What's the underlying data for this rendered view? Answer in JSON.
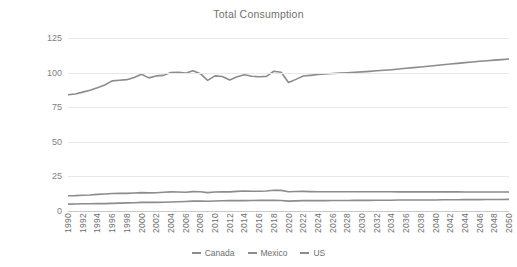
{
  "chart_data": {
    "type": "line",
    "title": "Total Consumption",
    "xlabel": "",
    "ylabel": "Quad Btu",
    "ylim": [
      0,
      125
    ],
    "yticks": [
      0,
      25,
      50,
      75,
      100,
      125
    ],
    "ytick_labels": [
      "0",
      "25",
      "50",
      "75",
      "100",
      "125"
    ],
    "grid": true,
    "legend_position": "bottom",
    "x": [
      1990,
      1991,
      1992,
      1993,
      1994,
      1995,
      1996,
      1997,
      1998,
      1999,
      2000,
      2001,
      2002,
      2003,
      2004,
      2005,
      2006,
      2007,
      2008,
      2009,
      2010,
      2011,
      2012,
      2013,
      2014,
      2015,
      2016,
      2017,
      2018,
      2019,
      2020,
      2021,
      2022,
      2023,
      2024,
      2025,
      2026,
      2027,
      2028,
      2029,
      2030,
      2031,
      2032,
      2033,
      2034,
      2035,
      2036,
      2037,
      2038,
      2039,
      2040,
      2041,
      2042,
      2043,
      2044,
      2045,
      2046,
      2047,
      2048,
      2049,
      2050
    ],
    "xtick_labels": [
      "1990",
      "1992",
      "1994",
      "1996",
      "1998",
      "2000",
      "2002",
      "2004",
      "2006",
      "2008",
      "2010",
      "2012",
      "2014",
      "2016",
      "2018",
      "2020",
      "2022",
      "2024",
      "2026",
      "2028",
      "2030",
      "2032",
      "2034",
      "2036",
      "2038",
      "2040",
      "2042",
      "2044",
      "2046",
      "2048",
      "2050"
    ],
    "series": [
      {
        "name": "Canada",
        "color": "#8c8c8c",
        "values": [
          11.0,
          11.1,
          11.4,
          11.6,
          12.0,
          12.3,
          12.6,
          12.7,
          12.7,
          13.0,
          13.3,
          13.1,
          13.2,
          13.6,
          13.8,
          13.7,
          13.6,
          14.0,
          13.9,
          13.3,
          13.7,
          13.9,
          13.8,
          14.2,
          14.4,
          14.3,
          14.3,
          14.5,
          15.0,
          14.9,
          13.9,
          14.1,
          14.2,
          14.0,
          13.9,
          13.9,
          13.9,
          13.9,
          13.9,
          13.9,
          13.9,
          13.9,
          13.9,
          13.9,
          13.9,
          13.8,
          13.8,
          13.8,
          13.8,
          13.8,
          13.8,
          13.8,
          13.8,
          13.8,
          13.7,
          13.7,
          13.7,
          13.7,
          13.7,
          13.7,
          13.7
        ]
      },
      {
        "name": "Mexico",
        "color": "#8c8c8c",
        "values": [
          5.0,
          5.1,
          5.2,
          5.2,
          5.4,
          5.3,
          5.5,
          5.7,
          5.9,
          6.0,
          6.2,
          6.2,
          6.2,
          6.3,
          6.5,
          6.7,
          6.9,
          7.1,
          7.2,
          7.0,
          7.2,
          7.4,
          7.5,
          7.5,
          7.5,
          7.6,
          7.7,
          7.7,
          7.7,
          7.6,
          7.1,
          7.3,
          7.5,
          7.5,
          7.5,
          7.5,
          7.6,
          7.6,
          7.6,
          7.7,
          7.7,
          7.7,
          7.8,
          7.8,
          7.8,
          7.9,
          7.9,
          7.9,
          8.0,
          8.0,
          8.0,
          8.1,
          8.1,
          8.1,
          8.2,
          8.2,
          8.2,
          8.3,
          8.3,
          8.3,
          8.4
        ]
      },
      {
        "name": "US",
        "color": "#8c8c8c",
        "values": [
          84.0,
          84.5,
          85.9,
          87.2,
          89.0,
          91.0,
          94.0,
          94.5,
          94.9,
          96.5,
          98.8,
          96.2,
          97.6,
          98.0,
          100.1,
          100.2,
          99.6,
          101.3,
          99.2,
          94.4,
          97.6,
          97.2,
          94.6,
          97.0,
          98.4,
          97.4,
          97.0,
          97.3,
          101.0,
          100.2,
          92.9,
          95.1,
          97.5,
          98.0,
          98.6,
          99.0,
          99.3,
          99.6,
          99.9,
          100.2,
          100.5,
          100.9,
          101.3,
          101.7,
          102.1,
          102.6,
          103.1,
          103.6,
          104.1,
          104.6,
          105.1,
          105.7,
          106.2,
          106.7,
          107.2,
          107.7,
          108.2,
          108.6,
          109.0,
          109.4,
          109.8
        ]
      }
    ]
  }
}
